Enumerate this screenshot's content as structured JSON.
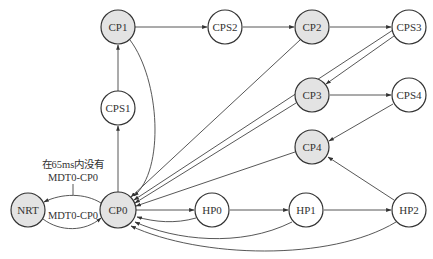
{
  "diagram": {
    "type": "state-transition",
    "colors": {
      "highlight": "#e3e3e3",
      "plain": "#ffffff",
      "stroke": "#333333"
    },
    "nodes": [
      {
        "id": "CP1",
        "label": "CP1",
        "x": 118,
        "y": 27,
        "shaded": true
      },
      {
        "id": "CPS2",
        "label": "CPS2",
        "x": 225,
        "y": 27,
        "shaded": false
      },
      {
        "id": "CP2",
        "label": "CP2",
        "x": 312,
        "y": 27,
        "shaded": true
      },
      {
        "id": "CPS3",
        "label": "CPS3",
        "x": 409,
        "y": 27,
        "shaded": false
      },
      {
        "id": "CPS1",
        "label": "CPS1",
        "x": 118,
        "y": 108,
        "shaded": false
      },
      {
        "id": "CP3",
        "label": "CP3",
        "x": 312,
        "y": 95,
        "shaded": true
      },
      {
        "id": "CPS4",
        "label": "CPS4",
        "x": 409,
        "y": 95,
        "shaded": false
      },
      {
        "id": "CP4",
        "label": "CP4",
        "x": 312,
        "y": 147,
        "shaded": true
      },
      {
        "id": "NRT",
        "label": "NRT",
        "x": 28,
        "y": 210,
        "shaded": true
      },
      {
        "id": "CP0",
        "label": "CP0",
        "x": 118,
        "y": 210,
        "shaded": true
      },
      {
        "id": "HP0",
        "label": "HP0",
        "x": 212,
        "y": 210,
        "shaded": false
      },
      {
        "id": "HP1",
        "label": "HP1",
        "x": 306,
        "y": 210,
        "shaded": false
      },
      {
        "id": "HP2",
        "label": "HP2",
        "x": 409,
        "y": 210,
        "shaded": false
      }
    ],
    "edges": [
      {
        "from": "CP0",
        "to": "CPS1"
      },
      {
        "from": "CPS1",
        "to": "CP1"
      },
      {
        "from": "CP1",
        "to": "CPS2"
      },
      {
        "from": "CPS2",
        "to": "CP2"
      },
      {
        "from": "CP2",
        "to": "CPS3"
      },
      {
        "from": "CPS3",
        "to": "CP3"
      },
      {
        "from": "CP3",
        "to": "CPS4"
      },
      {
        "from": "CPS4",
        "to": "CP4"
      },
      {
        "from": "HP2",
        "to": "CP4"
      },
      {
        "from": "CP0",
        "to": "HP0"
      },
      {
        "from": "HP0",
        "to": "HP1"
      },
      {
        "from": "HP1",
        "to": "HP2"
      },
      {
        "from": "CP1",
        "to": "CP0"
      },
      {
        "from": "CP2",
        "to": "CP0"
      },
      {
        "from": "CPS3",
        "to": "CP0"
      },
      {
        "from": "CP3",
        "to": "CP0"
      },
      {
        "from": "CP4",
        "to": "CP0"
      },
      {
        "from": "HP0",
        "to": "CP0"
      },
      {
        "from": "HP1",
        "to": "CP0"
      },
      {
        "from": "HP2",
        "to": "CP0"
      },
      {
        "from": "CP0",
        "to": "NRT",
        "label": "在65ms内没有 MDT0-CP0"
      },
      {
        "from": "NRT",
        "to": "CP0",
        "label": "MDT0-CP0"
      }
    ],
    "annotations": {
      "timeout_line1": "在65ms内没有",
      "timeout_line2": "MDT0-CP0",
      "return_label": "MDT0-CP0"
    }
  }
}
